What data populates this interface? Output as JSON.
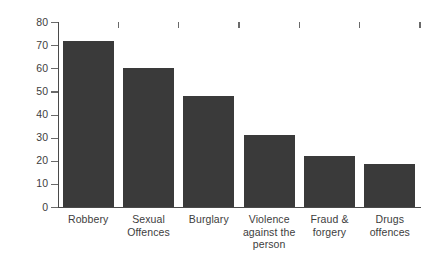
{
  "chart_data": {
    "type": "bar",
    "title": "",
    "subtitle": "",
    "xlabel": "",
    "ylabel": "Percentage",
    "ylim": [
      0,
      80
    ],
    "ytick_step": 10,
    "grid": false,
    "legend": "none",
    "bar_color": "#3a3a3a",
    "axis_color": "#4a4a4a",
    "text_color": "#3d3d3d",
    "categories": [
      "Robbery",
      "Sexual Offences",
      "Burglary",
      "Violence against the person",
      "Fraud & forgery",
      "Drugs offences"
    ],
    "category_lines": [
      [
        "Robbery"
      ],
      [
        "Sexual",
        "Offences"
      ],
      [
        "Burglary"
      ],
      [
        "Violence",
        "against the",
        "person"
      ],
      [
        "Fraud &",
        "forgery"
      ],
      [
        "Drugs",
        "offences"
      ]
    ],
    "values": [
      72,
      60,
      48,
      31,
      22,
      18.5
    ],
    "ytick_labels": [
      "0",
      "10",
      "20",
      "30",
      "40",
      "50",
      "60",
      "70",
      "80"
    ],
    "ytick_values": [
      0,
      10,
      20,
      30,
      40,
      50,
      60,
      70,
      80
    ]
  }
}
